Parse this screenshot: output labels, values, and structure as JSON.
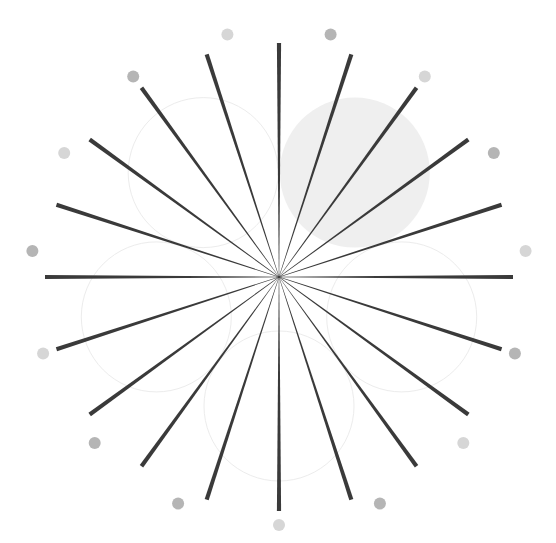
{
  "diagram": {
    "title": "",
    "canvas": {
      "width": 556,
      "height": 543,
      "background": "#ffffff"
    },
    "center": {
      "x": 279,
      "y": 277
    },
    "rays": {
      "count": 20,
      "start_angle_deg": 0,
      "step_deg": 18,
      "length": 234,
      "outer_width": 4.2,
      "inner_width": 0.4,
      "color": "#3a3a3a"
    },
    "dots": {
      "count": 15,
      "start_angle_deg": 12,
      "step_deg": 24,
      "distance": 248,
      "radius": 6,
      "colors": [
        "#b5b5b5",
        "#d6d6d6"
      ],
      "shade_pattern": [
        "dark",
        "light",
        "dark",
        "light",
        "dark",
        "light",
        "dark",
        "light",
        "dark",
        "dark",
        "light",
        "dark",
        "light",
        "dark",
        "light"
      ]
    },
    "circles": {
      "count": 5,
      "start_angle_deg": 36,
      "step_deg": 72,
      "distance": 129,
      "radius": 75,
      "stroke": "#ececec",
      "stroke_width": 1,
      "filled_index": 0,
      "fill": "#efefef"
    }
  }
}
